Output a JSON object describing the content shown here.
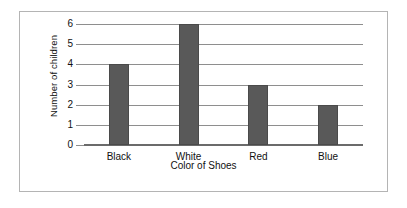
{
  "chart_data": {
    "type": "bar",
    "title": "",
    "xlabel": "Color of Shoes",
    "ylabel": "Number of children",
    "categories": [
      "Black",
      "White",
      "Red",
      "Blue"
    ],
    "values": [
      4,
      6,
      3,
      2
    ],
    "ylim": [
      0,
      6
    ],
    "ytick_labels": [
      "0",
      "1",
      "2",
      "3",
      "4",
      "5",
      "6"
    ],
    "ytick_values": [
      0,
      1,
      2,
      3,
      4,
      5,
      6
    ],
    "grid": "horizontal",
    "legend": "none",
    "bar_color": "#595959",
    "gridline_color": "#8e8e8e",
    "axis_color": "#6b6b6b",
    "frame_color": "#b4b4b4",
    "background": "#ffffff"
  }
}
